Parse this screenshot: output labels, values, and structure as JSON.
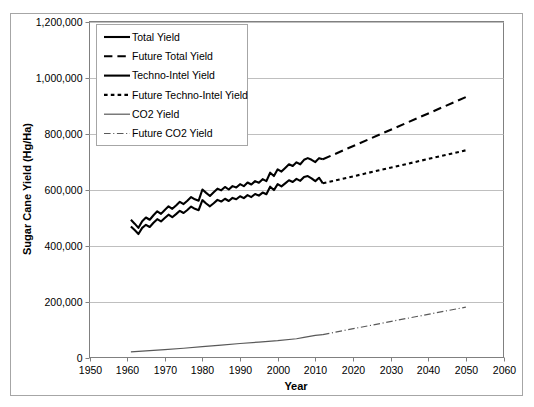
{
  "chart_data": {
    "type": "line",
    "title": "",
    "xlabel": "Year",
    "ylabel": "Sugar Cane Yield (Hg/Ha)",
    "xlim": [
      1950,
      2060
    ],
    "ylim": [
      0,
      1200000
    ],
    "xticks": [
      1950,
      1960,
      1970,
      1980,
      1990,
      2000,
      2010,
      2020,
      2030,
      2040,
      2050,
      2060
    ],
    "xtick_labels": [
      "1950",
      "1960",
      "1970",
      "1980",
      "1990",
      "2000",
      "2010",
      "2020",
      "2030",
      "2040",
      "2050",
      "2060"
    ],
    "yticks": [
      0,
      200000,
      400000,
      600000,
      800000,
      1000000,
      1200000
    ],
    "ytick_labels": [
      "0",
      "200,000",
      "400,000",
      "600,000",
      "800,000",
      "1,000,000",
      "1,200,000"
    ],
    "grid": "horizontal",
    "legend_position": "upper-left",
    "legend_entries": [
      {
        "label": "Total Yield",
        "style": "solid",
        "color": "#000000",
        "width": 2.1
      },
      {
        "label": "Future Total Yield",
        "style": "long-dash",
        "color": "#000000",
        "width": 2.1
      },
      {
        "label": "Techno-Intel Yield",
        "style": "solid",
        "color": "#000000",
        "width": 2.1
      },
      {
        "label": "Future Techno-Intel Yield",
        "style": "short-dash",
        "color": "#000000",
        "width": 2.1
      },
      {
        "label": "CO2 Yield",
        "style": "solid",
        "color": "#595959",
        "width": 1.2
      },
      {
        "label": "Future CO2 Yield",
        "style": "dash-dot",
        "color": "#595959",
        "width": 1.2
      }
    ],
    "series": [
      {
        "name": "Total Yield",
        "style": "solid",
        "color": "#000000",
        "width": 2.1,
        "x": [
          1961,
          1962,
          1963,
          1964,
          1965,
          1966,
          1967,
          1968,
          1969,
          1970,
          1971,
          1972,
          1973,
          1974,
          1975,
          1976,
          1977,
          1978,
          1979,
          1980,
          1981,
          1982,
          1983,
          1984,
          1985,
          1986,
          1987,
          1988,
          1989,
          1990,
          1991,
          1992,
          1993,
          1994,
          1995,
          1996,
          1997,
          1998,
          1999,
          2000,
          2001,
          2002,
          2003,
          2004,
          2005,
          2006,
          2007,
          2008,
          2009,
          2010,
          2011,
          2012
        ],
        "values": [
          492000,
          478000,
          463000,
          487000,
          500000,
          492000,
          508000,
          522000,
          513000,
          527000,
          540000,
          531000,
          543000,
          556000,
          548000,
          560000,
          573000,
          565000,
          560000,
          600000,
          588000,
          577000,
          590000,
          603000,
          597000,
          609000,
          600000,
          612000,
          607000,
          619000,
          612000,
          625000,
          618000,
          630000,
          624000,
          637000,
          630000,
          660000,
          648000,
          672000,
          664000,
          677000,
          690000,
          684000,
          697000,
          690000,
          706000,
          712000,
          706000,
          698000,
          712000,
          708000
        ]
      },
      {
        "name": "Techno-Intel Yield",
        "style": "solid",
        "color": "#000000",
        "width": 2.1,
        "x": [
          1961,
          1962,
          1963,
          1964,
          1965,
          1966,
          1967,
          1968,
          1969,
          1970,
          1971,
          1972,
          1973,
          1974,
          1975,
          1976,
          1977,
          1978,
          1979,
          1980,
          1981,
          1982,
          1983,
          1984,
          1985,
          1986,
          1987,
          1988,
          1989,
          1990,
          1991,
          1992,
          1993,
          1994,
          1995,
          1996,
          1997,
          1998,
          1999,
          2000,
          2001,
          2002,
          2003,
          2004,
          2005,
          2006,
          2007,
          2008,
          2009,
          2010,
          2011,
          2012
        ],
        "values": [
          468000,
          455000,
          441000,
          463000,
          474000,
          466000,
          481000,
          494000,
          486000,
          498000,
          510000,
          501000,
          512000,
          524000,
          516000,
          527000,
          539000,
          531000,
          526000,
          562000,
          550000,
          540000,
          551000,
          563000,
          557000,
          567000,
          559000,
          570000,
          565000,
          576000,
          569000,
          580000,
          573000,
          584000,
          578000,
          589000,
          583000,
          610000,
          598000,
          619000,
          611000,
          622000,
          633000,
          627000,
          638000,
          631000,
          645000,
          648000,
          640000,
          630000,
          642000,
          622000
        ]
      },
      {
        "name": "CO2 Yield",
        "style": "solid",
        "color": "#595959",
        "width": 1.2,
        "x": [
          1961,
          1965,
          1970,
          1975,
          1980,
          1985,
          1990,
          1995,
          2000,
          2005,
          2007,
          2010,
          2012
        ],
        "values": [
          20000,
          24000,
          28000,
          33000,
          39000,
          44000,
          50000,
          55000,
          60000,
          67000,
          72000,
          79000,
          82000
        ]
      },
      {
        "name": "Future Total Yield",
        "style": "long-dash",
        "color": "#000000",
        "width": 2.1,
        "x": [
          2012,
          2050
        ],
        "values": [
          708000,
          930000
        ]
      },
      {
        "name": "Future Techno-Intel Yield",
        "style": "short-dash",
        "color": "#000000",
        "width": 2.1,
        "x": [
          2012,
          2050
        ],
        "values": [
          622000,
          740000
        ]
      },
      {
        "name": "Future CO2 Yield",
        "style": "dash-dot",
        "color": "#595959",
        "width": 1.2,
        "x": [
          2012,
          2050
        ],
        "values": [
          82000,
          180000
        ]
      }
    ]
  },
  "frame": {
    "border_color": "#a6a6a6",
    "plot_border_color": "#808080",
    "grid_color": "#bfbfbf"
  }
}
